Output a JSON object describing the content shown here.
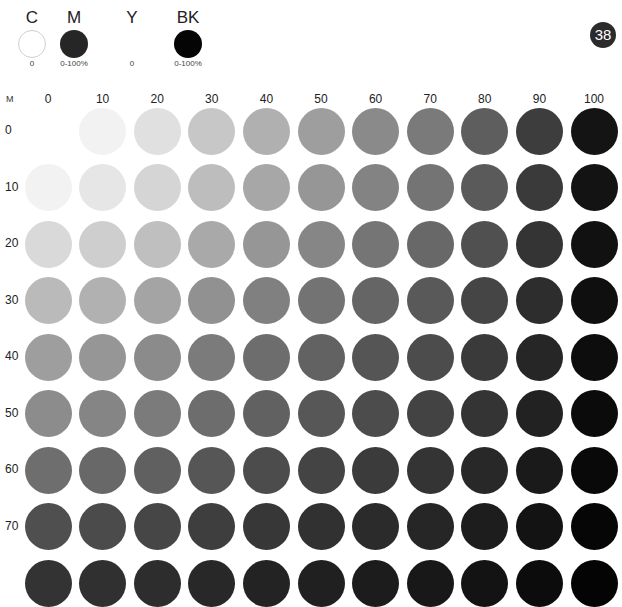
{
  "legend": [
    {
      "letter": "C",
      "range": "0",
      "swatch": "empty",
      "x": 2
    },
    {
      "letter": "M",
      "range": "0-100%",
      "swatch": "#262626",
      "x": 44
    },
    {
      "letter": "Y",
      "range": "0",
      "swatch": "hidden",
      "x": 102
    },
    {
      "letter": "BK",
      "range": "0-100%",
      "swatch": "#050505",
      "x": 158
    }
  ],
  "page_number": "38",
  "axis_label": "M",
  "chart_data": {
    "type": "heatmap",
    "xlabel": "BK %",
    "ylabel": "M %",
    "x": [
      "0",
      "10",
      "20",
      "30",
      "40",
      "50",
      "60",
      "70",
      "80",
      "90",
      "100"
    ],
    "y": [
      "0",
      "10",
      "20",
      "30",
      "40",
      "50",
      "60",
      "70",
      "80"
    ],
    "row_labels_visible": [
      "0",
      "10",
      "20",
      "30",
      "40",
      "50",
      "60",
      "70"
    ],
    "colors": [
      [
        "#ffffff",
        "#f2f2f2",
        "#e0e0e0",
        "#c7c7c7",
        "#b0b0b0",
        "#9e9e9e",
        "#8a8a8a",
        "#7a7a7a",
        "#5e5e5e",
        "#3d3d3d",
        "#141414"
      ],
      [
        "#f2f2f2",
        "#e6e6e6",
        "#d5d5d5",
        "#bdbdbd",
        "#a7a7a7",
        "#969696",
        "#838383",
        "#747474",
        "#5a5a5a",
        "#3a3a3a",
        "#131313"
      ],
      [
        "#d9d9d9",
        "#cecece",
        "#bfbfbf",
        "#a9a9a9",
        "#969696",
        "#868686",
        "#757575",
        "#686868",
        "#505050",
        "#343434",
        "#111111"
      ],
      [
        "#bababa",
        "#b1b1b1",
        "#a4a4a4",
        "#919191",
        "#808080",
        "#737373",
        "#656565",
        "#595959",
        "#454545",
        "#2d2d2d",
        "#0f0f0f"
      ],
      [
        "#9e9e9e",
        "#969696",
        "#8b8b8b",
        "#7b7b7b",
        "#6d6d6d",
        "#626262",
        "#555555",
        "#4c4c4c",
        "#3a3a3a",
        "#262626",
        "#0d0d0d"
      ],
      [
        "#8c8c8c",
        "#858585",
        "#7b7b7b",
        "#6d6d6d",
        "#616161",
        "#575757",
        "#4c4c4c",
        "#434343",
        "#343434",
        "#222222",
        "#0b0b0b"
      ],
      [
        "#6e6e6e",
        "#686868",
        "#606060",
        "#565656",
        "#4c4c4c",
        "#444444",
        "#3b3b3b",
        "#343434",
        "#282828",
        "#1a1a1a",
        "#090909"
      ],
      [
        "#4f4f4f",
        "#4b4b4b",
        "#464646",
        "#3e3e3e",
        "#373737",
        "#313131",
        "#2b2b2b",
        "#262626",
        "#1d1d1d",
        "#131313",
        "#060606"
      ],
      [
        "#333333",
        "#303030",
        "#2d2d2d",
        "#282828",
        "#232323",
        "#202020",
        "#1c1c1c",
        "#181818",
        "#131313",
        "#0c0c0c",
        "#040404"
      ]
    ],
    "grid": false,
    "legend": [
      "C 0",
      "M 0-100%",
      "Y 0",
      "BK 0-100%"
    ]
  }
}
